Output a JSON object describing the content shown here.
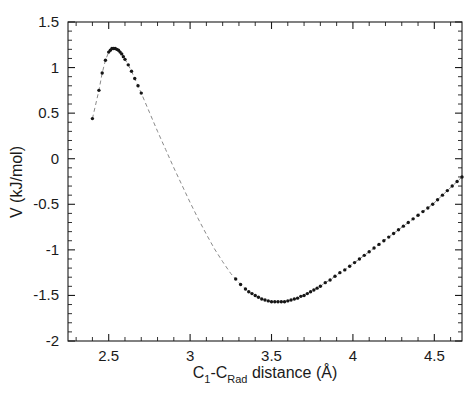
{
  "figure": {
    "background_color": "#ffffff",
    "foreground_color": "#1a1a1a",
    "marker_color": "#161616",
    "line_color": "#8a8a8a"
  },
  "axes": {
    "x": {
      "label_prefix": "C",
      "label_sub1": "1",
      "label_mid": "-C",
      "label_sub2": "Rad",
      "label_suffix": " distance (Å)",
      "label_full": "C1-CRad distance (Å)",
      "min": 2.25,
      "max": 4.67,
      "major_ticks": [
        2.5,
        3,
        3.5,
        4,
        4.5
      ],
      "major_tick_labels": [
        "2.5",
        "3",
        "3.5",
        "4",
        "4.5"
      ],
      "minor_tick_step": 0.1
    },
    "y": {
      "label_full": "V (kJ/mol)",
      "min": -2,
      "max": 1.5,
      "major_ticks": [
        1.5,
        1,
        0.5,
        0,
        -0.5,
        -1,
        -1.5,
        -2
      ],
      "major_tick_labels": [
        "1.5",
        "1",
        "0.5",
        "0",
        "-0.5",
        "-1",
        "-1.5",
        "-2"
      ],
      "minor_tick_step": 0.1
    }
  },
  "chart_data": {
    "type": "scatter",
    "title": "",
    "xlabel": "C1-CRad distance (Å)",
    "ylabel": "V (kJ/mol)",
    "xlim": [
      2.25,
      4.67
    ],
    "ylim": [
      -2,
      1.5
    ],
    "grid": false,
    "legend": null,
    "series": [
      {
        "name": "potential-energy-curve",
        "style": "dashed-line-with-dot-markers",
        "x": [
          2.4,
          2.44,
          2.46,
          2.48,
          2.5,
          2.51,
          2.52,
          2.53,
          2.54,
          2.55,
          2.56,
          2.57,
          2.58,
          2.59,
          2.6,
          2.62,
          2.64,
          2.66,
          2.68,
          2.7,
          2.75,
          2.8,
          2.85,
          2.9,
          2.95,
          3.0,
          3.05,
          3.1,
          3.15,
          3.2,
          3.25,
          3.28,
          3.31,
          3.34,
          3.36,
          3.38,
          3.4,
          3.42,
          3.44,
          3.46,
          3.48,
          3.5,
          3.52,
          3.54,
          3.56,
          3.58,
          3.6,
          3.62,
          3.64,
          3.66,
          3.68,
          3.7,
          3.72,
          3.74,
          3.76,
          3.78,
          3.8,
          3.83,
          3.86,
          3.89,
          3.92,
          3.95,
          3.98,
          4.01,
          4.04,
          4.07,
          4.1,
          4.13,
          4.16,
          4.19,
          4.22,
          4.25,
          4.28,
          4.31,
          4.34,
          4.37,
          4.4,
          4.43,
          4.46,
          4.49,
          4.52,
          4.55,
          4.58,
          4.61,
          4.64,
          4.67
        ],
        "y": [
          0.44,
          0.75,
          0.94,
          1.08,
          1.17,
          1.19,
          1.21,
          1.21,
          1.21,
          1.2,
          1.19,
          1.17,
          1.15,
          1.12,
          1.09,
          1.03,
          0.96,
          0.88,
          0.8,
          0.72,
          0.51,
          0.3,
          0.1,
          -0.1,
          -0.29,
          -0.48,
          -0.66,
          -0.83,
          -0.99,
          -1.13,
          -1.26,
          -1.32,
          -1.38,
          -1.43,
          -1.46,
          -1.48,
          -1.5,
          -1.52,
          -1.54,
          -1.55,
          -1.56,
          -1.57,
          -1.57,
          -1.57,
          -1.57,
          -1.57,
          -1.56,
          -1.55,
          -1.54,
          -1.53,
          -1.51,
          -1.5,
          -1.48,
          -1.46,
          -1.44,
          -1.42,
          -1.4,
          -1.36,
          -1.33,
          -1.29,
          -1.25,
          -1.22,
          -1.18,
          -1.14,
          -1.1,
          -1.06,
          -1.02,
          -0.98,
          -0.94,
          -0.9,
          -0.86,
          -0.82,
          -0.78,
          -0.74,
          -0.7,
          -0.66,
          -0.62,
          -0.58,
          -0.54,
          -0.5,
          -0.45,
          -0.4,
          -0.35,
          -0.3,
          -0.25,
          -0.2
        ],
        "marker_visible": [
          true,
          true,
          true,
          true,
          true,
          true,
          true,
          true,
          true,
          true,
          true,
          true,
          true,
          true,
          true,
          true,
          true,
          true,
          true,
          true,
          false,
          false,
          false,
          false,
          false,
          false,
          false,
          false,
          false,
          false,
          false,
          true,
          true,
          true,
          true,
          true,
          true,
          true,
          true,
          true,
          true,
          true,
          true,
          true,
          true,
          true,
          true,
          true,
          true,
          true,
          true,
          true,
          true,
          true,
          true,
          true,
          true,
          true,
          true,
          true,
          true,
          true,
          true,
          true,
          true,
          true,
          true,
          true,
          true,
          true,
          true,
          true,
          true,
          true,
          true,
          true,
          true,
          true,
          true,
          true,
          true,
          true,
          true,
          true,
          true,
          true
        ]
      }
    ],
    "annotations": {
      "barrier_maximum": {
        "x": 2.52,
        "y": 1.21
      },
      "well_minimum": {
        "x": 3.53,
        "y": -1.57
      },
      "left_isolated_point": {
        "x": 2.4,
        "y": 0.44
      }
    }
  }
}
